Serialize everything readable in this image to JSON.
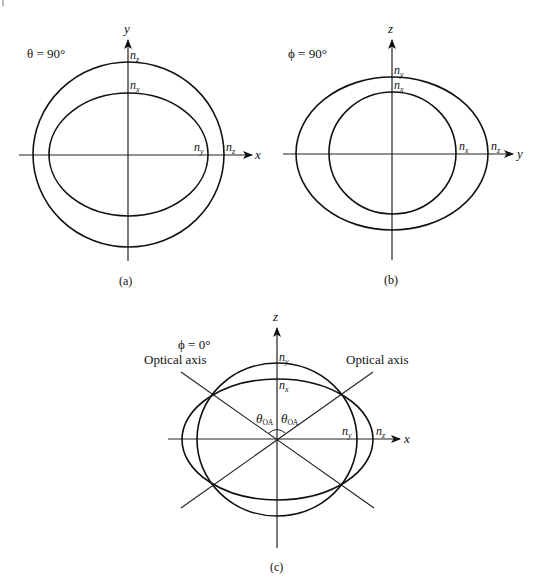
{
  "figure": {
    "panels": [
      {
        "id": "a",
        "caption": "(a)",
        "condition": "θ = 90°",
        "axes": {
          "horizontal": "x",
          "vertical": "y"
        },
        "curves": [
          {
            "name": "outer-circle",
            "label_top": "n_z",
            "label_right": "n_z"
          },
          {
            "name": "inner-ellipse",
            "label_top": "n_x",
            "label_right": "n_y"
          }
        ],
        "labels": {
          "top_outer": {
            "base": "n",
            "sub": "z"
          },
          "top_inner": {
            "base": "n",
            "sub": "x"
          },
          "right_inner": {
            "base": "n",
            "sub": "y"
          },
          "right_outer": {
            "base": "n",
            "sub": "z"
          }
        }
      },
      {
        "id": "b",
        "caption": "(b)",
        "condition": "ϕ = 90°",
        "axes": {
          "horizontal": "y",
          "vertical": "z"
        },
        "curves": [
          {
            "name": "outer-ellipse",
            "label_top": "n_y",
            "label_right": "n_z"
          },
          {
            "name": "inner-circle",
            "label_top": "n_x",
            "label_right": "n_x"
          }
        ],
        "labels": {
          "top_outer": {
            "base": "n",
            "sub": "y"
          },
          "top_inner": {
            "base": "n",
            "sub": "x"
          },
          "right_inner": {
            "base": "n",
            "sub": "x"
          },
          "right_outer": {
            "base": "n",
            "sub": "z"
          }
        }
      },
      {
        "id": "c",
        "caption": "(c)",
        "condition": "ϕ = 0°",
        "axes": {
          "horizontal": "x",
          "vertical": "z"
        },
        "curves": [
          {
            "name": "tall-oval",
            "label_top": "n_y",
            "label_right": "n_y"
          },
          {
            "name": "wide-ellipse",
            "label_top": "n_x",
            "label_right": "n_z"
          }
        ],
        "labels": {
          "top_outer": {
            "base": "n",
            "sub": "y"
          },
          "top_inner": {
            "base": "n",
            "sub": "x"
          },
          "right_inner": {
            "base": "n",
            "sub": "y"
          },
          "right_outer": {
            "base": "n",
            "sub": "z"
          }
        },
        "optical_axis_left": "Optical axis",
        "optical_axis_right": "Optical axis",
        "angle_symbol": "θ",
        "angle_sub": "OA"
      }
    ]
  }
}
